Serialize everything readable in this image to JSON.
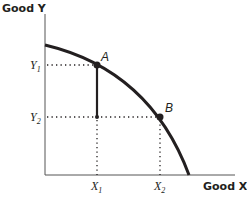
{
  "diagram": {
    "type": "production-possibility-frontier",
    "y_axis_label": "Good Y",
    "x_axis_label": "Good X",
    "y_ticks": [
      {
        "main": "Y",
        "sub": "1"
      },
      {
        "main": "Y",
        "sub": "2"
      }
    ],
    "x_ticks": [
      {
        "main": "X",
        "sub": "1"
      },
      {
        "main": "X",
        "sub": "2"
      }
    ],
    "points": [
      {
        "label": "A"
      },
      {
        "label": "B"
      }
    ],
    "colors": {
      "ink": "#231f20",
      "background": "#ffffff"
    }
  }
}
